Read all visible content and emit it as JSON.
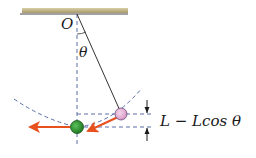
{
  "diagram": {
    "type": "pendulum",
    "labels": {
      "pivot": "O",
      "angle": "θ",
      "height": "L − Lcos θ"
    },
    "angle_symbol": "θ",
    "objects": [
      {
        "name": "ceiling",
        "description": "fixed support"
      },
      {
        "name": "string",
        "description": "pendulum string of length L"
      },
      {
        "name": "ball-displaced",
        "description": "bob at angle θ",
        "color": "#e9b3d6"
      },
      {
        "name": "ball-lowest",
        "description": "bob at lowest point",
        "color": "#2e9a2e"
      }
    ],
    "colors": {
      "ceiling": "#b8a878",
      "string": "#333333",
      "dashed": "#5a6ea8",
      "arrow": "#e8501e",
      "ball_pink": "#e9b3d6",
      "ball_green": "#2e9a2e"
    }
  }
}
